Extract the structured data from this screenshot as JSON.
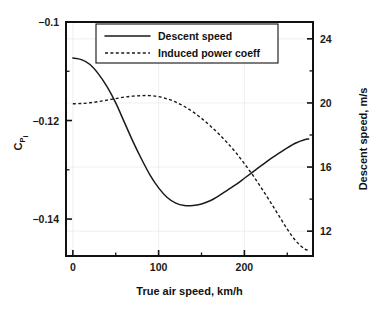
{
  "chart_data": {
    "type": "line",
    "title": "",
    "xlabel": "True air speed, km/h",
    "ylabel_left": "C",
    "ylabel_left_sub": "P",
    "ylabel_left_sub2": "i",
    "ylabel_right": "Descent speed, m/s",
    "grid": true,
    "legend_position": "top-center",
    "xlim": [
      -8,
      280
    ],
    "ylim_left": [
      -0.1475,
      -0.1
    ],
    "ylim_right": [
      10.45,
      25.05
    ],
    "xticks": [
      0,
      100,
      200
    ],
    "xtick_labels": [
      "0",
      "100",
      "200"
    ],
    "xticks_minor": [
      50,
      150,
      250
    ],
    "yticks_left": [
      -0.1,
      -0.12,
      -0.14
    ],
    "ytick_labels_left": [
      "−0.1",
      "−0.12",
      "−0.14"
    ],
    "yticks_left_minor": [
      -0.11,
      -0.13
    ],
    "yticks_right": [
      24,
      20,
      16,
      12
    ],
    "ytick_labels_right": [
      "24",
      "20",
      "16",
      "12"
    ],
    "yticks_right_minor": [
      22,
      18,
      14
    ],
    "series": [
      {
        "name": "Descent speed",
        "style": "solid",
        "axis": "right",
        "color": "#1a1a1a",
        "x": [
          0,
          10,
          20,
          30,
          40,
          50,
          60,
          70,
          80,
          90,
          100,
          110,
          120,
          130,
          140,
          150,
          160,
          170,
          180,
          190,
          200,
          210,
          220,
          230,
          240,
          250,
          260,
          270,
          275
        ],
        "y": [
          22.8,
          22.7,
          22.4,
          21.8,
          21.0,
          20.0,
          18.8,
          17.6,
          16.5,
          15.5,
          14.7,
          14.1,
          13.75,
          13.6,
          13.6,
          13.7,
          13.9,
          14.2,
          14.55,
          14.9,
          15.3,
          15.7,
          16.1,
          16.5,
          16.85,
          17.2,
          17.5,
          17.7,
          17.75
        ]
      },
      {
        "name": "Induced power coeff",
        "style": "dotted",
        "axis": "left",
        "color": "#1a1a1a",
        "x": [
          0,
          10,
          20,
          30,
          40,
          50,
          60,
          70,
          80,
          90,
          100,
          110,
          120,
          130,
          140,
          150,
          160,
          170,
          180,
          190,
          200,
          210,
          220,
          230,
          240,
          250,
          260,
          270,
          275
        ],
        "y": [
          -0.1166,
          -0.11655,
          -0.1164,
          -0.11615,
          -0.11585,
          -0.11555,
          -0.11525,
          -0.11505,
          -0.11495,
          -0.11495,
          -0.11515,
          -0.1156,
          -0.11625,
          -0.11715,
          -0.11825,
          -0.11955,
          -0.12105,
          -0.1227,
          -0.1245,
          -0.1265,
          -0.12875,
          -0.13115,
          -0.13375,
          -0.13645,
          -0.13925,
          -0.14205,
          -0.14445,
          -0.14605,
          -0.1463
        ]
      }
    ]
  },
  "legend": {
    "items": [
      {
        "label": "Descent speed",
        "style": "solid"
      },
      {
        "label": "Induced power coeff",
        "style": "dotted"
      }
    ]
  }
}
